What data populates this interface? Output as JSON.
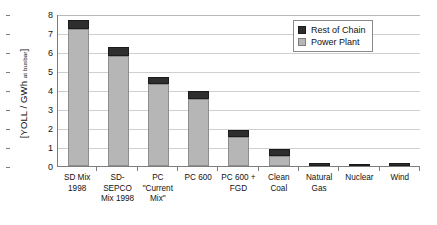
{
  "chart_data": {
    "type": "bar",
    "title": "",
    "xlabel": "",
    "ylabel": "[YOLL / GWh at busbar]",
    "ylabel_main": "[YOLL / GWh ",
    "ylabel_sub": "at busbar",
    "ylabel_close": "]",
    "ylim": [
      0,
      8
    ],
    "yticks": [
      8,
      7,
      6,
      5,
      4,
      3,
      2,
      1,
      0
    ],
    "grid": true,
    "stacked": true,
    "legend_position": "top-right",
    "categories": [
      "SD Mix 1998",
      "SD-SEPCO Mix 1998",
      "PC \"Current Mix\"",
      "PC 600",
      "PC 600 + FGD",
      "Clean Coal",
      "Natural Gas",
      "Nuclear",
      "Wind"
    ],
    "category_lines": [
      [
        "SD Mix",
        "1998"
      ],
      [
        "SD-",
        "SEPCO",
        "Mix 1998"
      ],
      [
        "PC",
        "\"Current",
        "Mix\""
      ],
      [
        "PC 600"
      ],
      [
        "PC 600 +",
        "FGD"
      ],
      [
        "Clean",
        "Coal"
      ],
      [
        "Natural",
        "Gas"
      ],
      [
        "Nuclear"
      ],
      [
        "Wind"
      ]
    ],
    "series": [
      {
        "name": "Power Plant",
        "color": "#b6b6b6",
        "values": [
          7.22,
          5.8,
          4.33,
          3.55,
          1.52,
          0.55,
          0.02,
          0.01,
          0.02
        ]
      },
      {
        "name": "Rest of Chain",
        "color": "#2e2e2e",
        "values": [
          0.48,
          0.48,
          0.37,
          0.42,
          0.4,
          0.33,
          0.15,
          0.06,
          0.15
        ]
      }
    ],
    "totals": [
      7.7,
      6.28,
      4.7,
      3.97,
      1.92,
      0.88,
      0.17,
      0.07,
      0.17
    ]
  },
  "legend": {
    "items": [
      {
        "label": "Rest of Chain",
        "swatch": "rest"
      },
      {
        "label": "Power Plant",
        "swatch": "plant"
      }
    ]
  }
}
